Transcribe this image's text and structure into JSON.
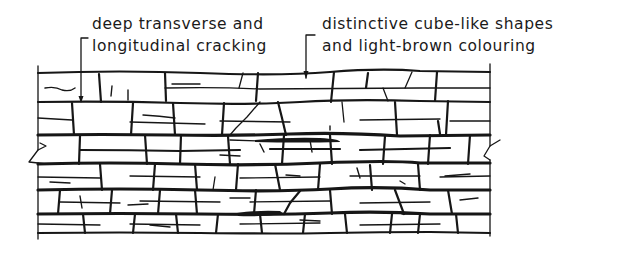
{
  "figure": {
    "type": "engineering line drawing",
    "ink_color": "#161616",
    "background_color": "#ffffff"
  },
  "annotations": [
    {
      "id": "cracking",
      "lines": [
        "deep transverse and",
        "longitudinal cracking"
      ],
      "leader": "bracket leader with arrow pointing into the top-left block"
    },
    {
      "id": "cube-shapes",
      "lines": [
        "distinctive cube-like shapes",
        "and light-brown colouring"
      ],
      "leader": "bracket leader with arrow pointing to the top edge"
    }
  ],
  "drawing": {
    "courses": 7,
    "break_marks": [
      "left",
      "right"
    ]
  }
}
